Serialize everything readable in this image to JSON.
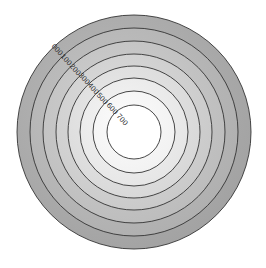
{
  "figure": {
    "background_color": "#ffffff",
    "line_color": "#333333",
    "label_color": "#2b2b2b"
  },
  "chart_data": {
    "type": "contour",
    "title": "",
    "subtitle": "",
    "xlabel": "",
    "ylabel": "",
    "grid": false,
    "legend": null,
    "axes_visible": false,
    "center": {
      "x": 134,
      "y": 132
    },
    "shape": "concentric-circles",
    "levels": [
      {
        "label": "000",
        "value": 0,
        "radius": 117,
        "fill": "#a3a3a3",
        "fill_inner": "#b8b8b8",
        "label_x": 57,
        "label_y": 50,
        "label_rotation": 47
      },
      {
        "label": "100",
        "value": 100,
        "radius": 104,
        "fill": "#b0b0b0",
        "fill_inner": "#c2c2c2",
        "label_x": 66,
        "label_y": 60,
        "label_rotation": 47
      },
      {
        "label": "200",
        "value": 200,
        "radius": 91,
        "fill": "#bdbdbd",
        "fill_inner": "#cfcfcf",
        "label_x": 75,
        "label_y": 70,
        "label_rotation": 47
      },
      {
        "label": "300",
        "value": 300,
        "radius": 78,
        "fill": "#cacaca",
        "fill_inner": "#dcdcdc",
        "label_x": 84,
        "label_y": 79,
        "label_rotation": 47
      },
      {
        "label": "400",
        "value": 400,
        "radius": 66,
        "fill": "#d8d8d8",
        "fill_inner": "#e9e9e9",
        "label_x": 93,
        "label_y": 89,
        "label_rotation": 47
      },
      {
        "label": "500",
        "value": 500,
        "radius": 54,
        "fill": "#e6e6e6",
        "fill_inner": "#f4f4f4",
        "label_x": 102,
        "label_y": 99,
        "label_rotation": 47
      },
      {
        "label": "600",
        "value": 600,
        "radius": 41,
        "fill": "#f2f2f2",
        "fill_inner": "#fbfbfb",
        "label_x": 112,
        "label_y": 109,
        "label_rotation": 47
      },
      {
        "label": "700",
        "value": 700,
        "radius": 27,
        "fill": "#ffffff",
        "fill_inner": "#ffffff",
        "label_x": 122,
        "label_y": 120,
        "label_rotation": 47
      }
    ],
    "level_values": [
      0,
      100,
      200,
      300,
      400,
      500,
      600,
      700
    ],
    "level_labels": [
      "000",
      "100",
      "200",
      "300",
      "400",
      "500",
      "600",
      "700"
    ],
    "colormap": "grayscale-inverted"
  }
}
